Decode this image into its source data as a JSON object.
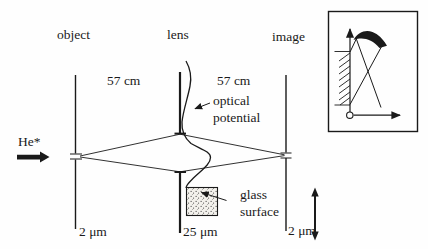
{
  "figure": {
    "columns": {
      "object_label": "object",
      "lens_label": "lens",
      "image_label": "image"
    },
    "distances": {
      "left": "57 cm",
      "right": "57 cm"
    },
    "annotations": {
      "optical_potential": "optical potential",
      "glass_surface": "glass surface",
      "beam": "He*"
    },
    "scale_bars": {
      "object": "2 μm",
      "lens": "25 μm",
      "image": "2 μm"
    },
    "colors": {
      "ink": "#1a1a1a",
      "background": "#fefefe",
      "glass_fill": "#f3f1ec"
    }
  }
}
